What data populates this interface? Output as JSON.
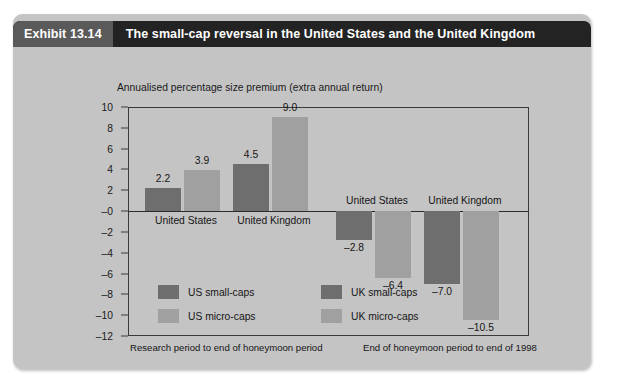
{
  "exhibit": {
    "number": "Exhibit 13.14",
    "title": "The small-cap reversal in the United States and the United Kingdom"
  },
  "colors": {
    "card_background": "#c4c4c4",
    "header_background": "#232323",
    "number_background": "#5a5a5a",
    "small_cap": "#6e6e6e",
    "micro_cap": "#a0a0a0",
    "axis": "#3a3a3a",
    "text": "#151515"
  },
  "chart_data": {
    "type": "bar",
    "title": "The small-cap reversal in the United States and the United Kingdom",
    "subtitle": "Annualised percentage size premium (extra annual return)",
    "xlabel": "",
    "ylabel": "",
    "ylim": [
      -12,
      10
    ],
    "yticks": [
      10,
      8,
      6,
      4,
      2,
      0,
      -2,
      -4,
      -6,
      -8,
      -10,
      -12
    ],
    "ytick_labels": [
      "10",
      "8",
      "6",
      "4",
      "2",
      "–0",
      "–2",
      "–4",
      "–6",
      "–8",
      "–10",
      "–12"
    ],
    "grid": false,
    "legend_position": "inside-lower-left",
    "panels": [
      {
        "caption": "Research period to end of honeymoon period",
        "groups": [
          {
            "label": "United States",
            "bars": [
              {
                "series": "US small-caps",
                "value": 2.2,
                "label": "2.2",
                "style": "small-cap"
              },
              {
                "series": "US micro-caps",
                "value": 3.9,
                "label": "3.9",
                "style": "micro-cap"
              }
            ]
          },
          {
            "label": "United Kingdom",
            "bars": [
              {
                "series": "UK small-caps",
                "value": 4.5,
                "label": "4.5",
                "style": "small-cap"
              },
              {
                "series": "UK micro-caps",
                "value": 9.0,
                "label": "9.0",
                "style": "micro-cap"
              }
            ]
          }
        ]
      },
      {
        "caption": "End of honeymoon period to end of 1998",
        "groups": [
          {
            "label": "United States",
            "bars": [
              {
                "series": "US small-caps",
                "value": -2.8,
                "label": "–2.8",
                "style": "small-cap"
              },
              {
                "series": "US micro-caps",
                "value": -6.4,
                "label": "–6.4",
                "style": "micro-cap"
              }
            ]
          },
          {
            "label": "United Kingdom",
            "bars": [
              {
                "series": "UK small-caps",
                "value": -7.0,
                "label": "–7.0",
                "style": "small-cap"
              },
              {
                "series": "UK micro-caps",
                "value": -10.5,
                "label": "–10.5",
                "style": "micro-cap"
              }
            ]
          }
        ]
      }
    ],
    "legend": [
      {
        "label": "US small-caps",
        "style": "small-cap"
      },
      {
        "label": "UK small-caps",
        "style": "small-cap"
      },
      {
        "label": "US micro-caps",
        "style": "micro-cap"
      },
      {
        "label": "UK micro-caps",
        "style": "micro-cap"
      }
    ]
  }
}
